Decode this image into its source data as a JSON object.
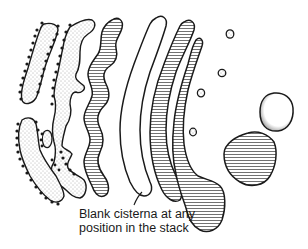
{
  "diagram": {
    "colors": {
      "outline": "#1a1a1a",
      "background": "#ffffff",
      "stipple": "#555555",
      "hatch": "#333333"
    },
    "structures": [
      {
        "name": "cis-cisterna-outer",
        "fill": "stippled",
        "ribosomes": true
      },
      {
        "name": "cis-cisterna-inner",
        "fill": "stippled",
        "ribosomes": true
      },
      {
        "name": "medial-cisterna-wavy",
        "fill": "hatched"
      },
      {
        "name": "blank-cisterna",
        "fill": "blank"
      },
      {
        "name": "trans-cisterna-1",
        "fill": "hatched"
      },
      {
        "name": "trans-cisterna-2",
        "fill": "hatched"
      },
      {
        "name": "small-vesicles",
        "count": 4
      },
      {
        "name": "large-vesicle-clear",
        "fill": "clear"
      },
      {
        "name": "large-vesicle-hatched",
        "fill": "hatched"
      }
    ],
    "annotation": {
      "line1": "Blank cisterna at any",
      "line2": "position in the stack"
    }
  }
}
